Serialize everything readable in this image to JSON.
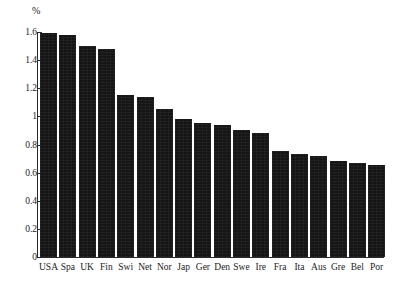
{
  "chart_data": {
    "type": "bar",
    "title": "",
    "subtitle": "",
    "xlabel": "",
    "ylabel": "%",
    "unit_label": "%",
    "ylim": [
      0,
      1.6
    ],
    "ytick_labels": [
      "1.6",
      "1.4",
      "1.2",
      "1",
      "0.8",
      "0.6",
      "0.4",
      "0.2",
      "0"
    ],
    "ytick_values": [
      1.6,
      1.4,
      1.2,
      1,
      0.8,
      0.6,
      0.4,
      0.2,
      0
    ],
    "grid": false,
    "legend": null,
    "bar_color": "#151515",
    "axis_color": "#2a2a2a",
    "background_color": "#ffffff",
    "categories": [
      "USA",
      "Spa",
      "UK",
      "Fin",
      "Swi",
      "Net",
      "Nor",
      "Jap",
      "Ger",
      "Den",
      "Swe",
      "Ire",
      "Fra",
      "Ita",
      "Aus",
      "Gre",
      "Bel",
      "Por"
    ],
    "values": [
      1.59,
      1.58,
      1.5,
      1.48,
      1.15,
      1.14,
      1.05,
      0.98,
      0.955,
      0.94,
      0.9,
      0.88,
      0.755,
      0.73,
      0.72,
      0.68,
      0.67,
      0.655
    ],
    "points": [
      {
        "category": "USA",
        "value": 1.59
      },
      {
        "category": "Spa",
        "value": 1.58
      },
      {
        "category": "UK",
        "value": 1.5
      },
      {
        "category": "Fin",
        "value": 1.48
      },
      {
        "category": "Swi",
        "value": 1.15
      },
      {
        "category": "Net",
        "value": 1.14
      },
      {
        "category": "Nor",
        "value": 1.05
      },
      {
        "category": "Jap",
        "value": 0.98
      },
      {
        "category": "Ger",
        "value": 0.955
      },
      {
        "category": "Den",
        "value": 0.94
      },
      {
        "category": "Swe",
        "value": 0.9
      },
      {
        "category": "Ire",
        "value": 0.88
      },
      {
        "category": "Fra",
        "value": 0.755
      },
      {
        "category": "Ita",
        "value": 0.73
      },
      {
        "category": "Aus",
        "value": 0.72
      },
      {
        "category": "Gre",
        "value": 0.68
      },
      {
        "category": "Bel",
        "value": 0.67
      },
      {
        "category": "Por",
        "value": 0.655
      }
    ]
  }
}
